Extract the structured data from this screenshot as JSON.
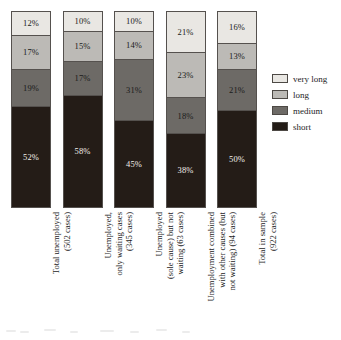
{
  "chart_data": {
    "type": "bar",
    "subtype": "stacked-percentage-column",
    "title": "",
    "subtitle": "",
    "xlabel": "",
    "ylabel": "",
    "ylim": [
      0,
      100
    ],
    "grid": false,
    "legend_position": "right",
    "value_suffix": "%",
    "categories": [
      "Total unemployed\n(502 cases)",
      "Unemployed,\nonly waiting cases\n(345 cases)",
      "Unemployed\n(sole cause) but not\nwaiting (63 cases)",
      "Unemployment combined\nwith other causes (but\nnot waiting) (94 cases)",
      "Total in sample\n(922 cases)"
    ],
    "series": [
      {
        "name": "very long",
        "color": "#e9e7e3",
        "text_on": "light",
        "values": [
          12,
          10,
          10,
          21,
          16
        ],
        "labels": [
          "12%",
          "10%",
          "10%",
          "21%",
          "16%"
        ]
      },
      {
        "name": "long",
        "color": "#bcbab6",
        "text_on": "light",
        "values": [
          17,
          15,
          14,
          23,
          13
        ],
        "labels": [
          "17%",
          "15%",
          "14%",
          "23%",
          "13%"
        ]
      },
      {
        "name": "medium",
        "color": "#6d6a66",
        "text_on": "light",
        "values": [
          19,
          17,
          31,
          18,
          21
        ],
        "labels": [
          "19%",
          "17%",
          "31%",
          "18%",
          "21%"
        ]
      },
      {
        "name": "short",
        "color": "#241c17",
        "text_on": "dark",
        "values": [
          52,
          58,
          45,
          38,
          50
        ],
        "labels": [
          "52%",
          "58%",
          "45%",
          "38%",
          "50%"
        ]
      }
    ],
    "legend": [
      {
        "label": "very long",
        "color": "#e9e7e3"
      },
      {
        "label": "long",
        "color": "#bcbab6"
      },
      {
        "label": "medium",
        "color": "#6d6a66"
      },
      {
        "label": "short",
        "color": "#241c17"
      }
    ],
    "axis_labels": [
      "Total unemployed (502 cases)",
      "Unemployed, only waiting cases (345 cases)",
      "Unemployed (sole cause) but not waiting (63 cases)",
      "Unemployment combined with other causes (but not waiting) (94 cases)",
      "Total in sample (922 cases)"
    ],
    "colors": {
      "very_long": "#e9e7e3",
      "long": "#bcbab6",
      "medium": "#6d6a66",
      "short": "#241c17",
      "outline": "#55514e",
      "background": "#ffffff",
      "text": "#1d1d1d"
    }
  }
}
